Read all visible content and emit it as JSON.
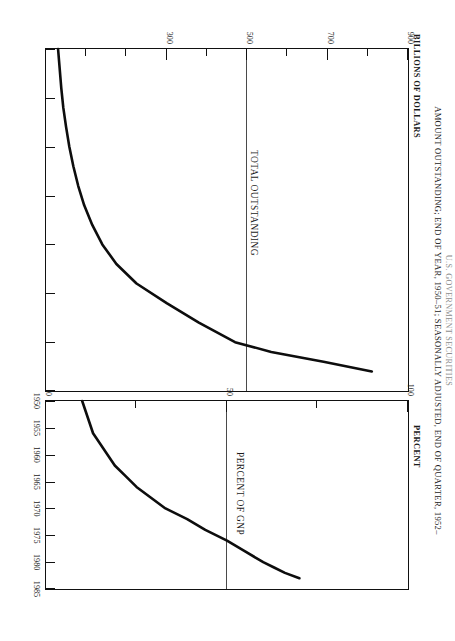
{
  "figure": {
    "title_top_partial": "U.S. GOVERNMENT SECURITIES",
    "subtitle": "AMOUNT OUTSTANDING; END OF YEAR, 1950–51; SEASONALLY ADJUSTED, END OF QUARTER, 1952–",
    "rotation_note": "90"
  },
  "panels": {
    "dollars": {
      "caption": "BILLIONS OF DOLLARS",
      "series_label": "TOTAL OUTSTANDING"
    },
    "percent": {
      "caption": "PERCENT",
      "series_label": "PERCENT OF GNP"
    }
  },
  "chart_data": [
    {
      "type": "line",
      "title": "TOTAL OUTSTANDING",
      "xlabel": "",
      "ylabel": "BILLIONS OF DOLLARS",
      "xlim": [
        1950,
        1985
      ],
      "ylim": [
        0,
        900
      ],
      "yticks_major": [
        300,
        500,
        700,
        900
      ],
      "yticks_minor": [
        100,
        200,
        400,
        600,
        800
      ],
      "ytick_labels": [
        "300",
        "500",
        "700",
        "900"
      ],
      "xticks": [
        1950,
        1955,
        1960,
        1965,
        1970,
        1975,
        1980,
        1985
      ],
      "xtick_labels": [
        "1950",
        "1955",
        "1960",
        "1965",
        "1970",
        "1975",
        "1980",
        "1985"
      ],
      "gridline_at": 500,
      "grid": false,
      "legend": "none",
      "x": [
        1950,
        1952,
        1954,
        1956,
        1958,
        1960,
        1962,
        1964,
        1966,
        1968,
        1970,
        1972,
        1974,
        1976,
        1978,
        1980,
        1981,
        1982,
        1983
      ],
      "values": [
        30,
        34,
        38,
        43,
        50,
        58,
        68,
        80,
        95,
        115,
        140,
        175,
        225,
        300,
        380,
        470,
        560,
        690,
        810
      ]
    },
    {
      "type": "line",
      "title": "PERCENT OF GNP",
      "xlabel": "",
      "ylabel": "PERCENT",
      "xlim": [
        1950,
        1985
      ],
      "ylim": [
        0,
        100
      ],
      "yticks_major": [
        0,
        50,
        100
      ],
      "yticks_minor": [
        25,
        75
      ],
      "ytick_labels": [
        "0",
        "50",
        "100"
      ],
      "xticks": [
        1950,
        1955,
        1960,
        1965,
        1970,
        1975,
        1980,
        1985
      ],
      "xtick_labels": [
        "1950",
        "1955",
        "1960",
        "1965",
        "1970",
        "1975",
        "1980",
        "1985"
      ],
      "gridline_at": 50,
      "grid": false,
      "legend": "none",
      "x": [
        1950,
        1952,
        1954,
        1956,
        1958,
        1960,
        1962,
        1964,
        1966,
        1968,
        1970,
        1972,
        1974,
        1976,
        1978,
        1980,
        1981,
        1982,
        1983
      ],
      "values": [
        10,
        11,
        12,
        13,
        15,
        17,
        19,
        22,
        25,
        29,
        33,
        39,
        44,
        50,
        55,
        60,
        63,
        66,
        70
      ]
    }
  ]
}
